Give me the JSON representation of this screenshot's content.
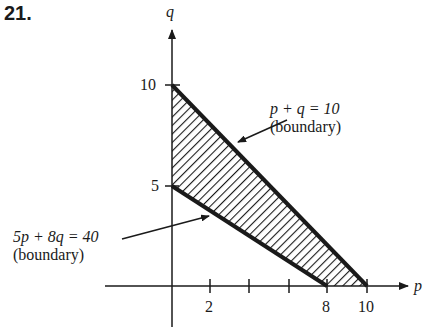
{
  "problem_number": "21.",
  "axes": {
    "x_label": "p",
    "y_label": "q",
    "x_ticks": [
      {
        "value": 2,
        "label": "2"
      },
      {
        "value": 4,
        "label": ""
      },
      {
        "value": 6,
        "label": ""
      },
      {
        "value": 8,
        "label": "8"
      },
      {
        "value": 10,
        "label": "10"
      }
    ],
    "y_ticks": [
      {
        "value": 5,
        "label": "5"
      },
      {
        "value": 10,
        "label": "10"
      }
    ]
  },
  "region": {
    "vertices": [
      [
        0,
        10
      ],
      [
        10,
        0
      ],
      [
        8,
        0
      ],
      [
        0,
        5
      ]
    ],
    "fill": "hatched"
  },
  "annotations": [
    {
      "equation": "p + q = 10",
      "note": "(boundary)"
    },
    {
      "equation": "5p + 8q = 40",
      "note": "(boundary)"
    }
  ],
  "colors": {
    "ink": "#1a1a1a",
    "background": "#ffffff"
  }
}
